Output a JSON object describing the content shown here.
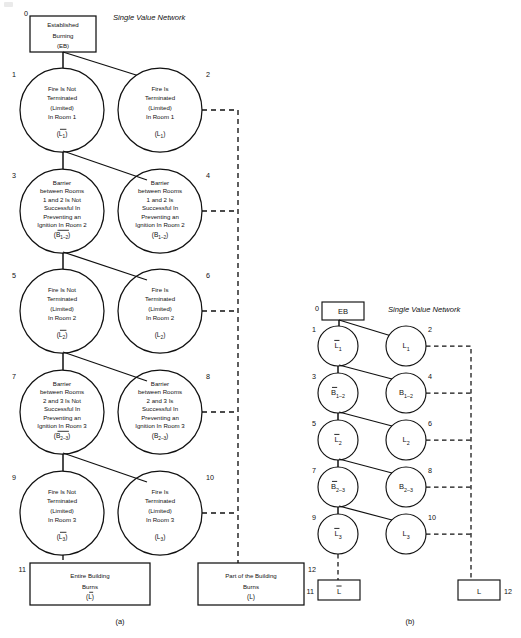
{
  "figure": {
    "panel_a_caption": "(a)",
    "panel_b_caption": "(b)",
    "network_title": "Single Value Network"
  },
  "panel_a": {
    "root": {
      "number": "0",
      "lines": [
        "Established",
        "Burning",
        "(EB)"
      ],
      "shape": "rectangle"
    },
    "nodes": [
      {
        "number": "1",
        "lines": [
          "Fire Is Not",
          "Terminated",
          "(Limited)",
          "In Room 1"
        ],
        "symbol": "L",
        "sub": "1",
        "overbar": true,
        "column": "left"
      },
      {
        "number": "2",
        "lines": [
          "Fire Is",
          "Terminated",
          "(Limited)",
          "In Room 1"
        ],
        "symbol": "L",
        "sub": "1",
        "overbar": false,
        "column": "right"
      },
      {
        "number": "3",
        "lines": [
          "Barrier",
          "between Rooms",
          "1 and 2 Is Not",
          "Successful In",
          "Preventing an",
          "Ignition In Room 2"
        ],
        "symbol": "B",
        "sub": "1–2",
        "overbar": true,
        "column": "left"
      },
      {
        "number": "4",
        "lines": [
          "Barrier",
          "between Rooms",
          "1 and 2 Is",
          "Successful In",
          "Preventing an",
          "Ignition In Room 2"
        ],
        "symbol": "B",
        "sub": "1–2",
        "overbar": false,
        "column": "right"
      },
      {
        "number": "5",
        "lines": [
          "Fire Is Not",
          "Terminated",
          "(Limited)",
          "In Room 2"
        ],
        "symbol": "L",
        "sub": "2",
        "overbar": true,
        "column": "left"
      },
      {
        "number": "6",
        "lines": [
          "Fire Is",
          "Terminated",
          "(Limited)",
          "In Room 2"
        ],
        "symbol": "L",
        "sub": "2",
        "overbar": false,
        "column": "right"
      },
      {
        "number": "7",
        "lines": [
          "Barrier",
          "between Rooms",
          "2 and 3 Is Not",
          "Successful In",
          "Preventing an",
          "Ignition In Room 3"
        ],
        "symbol": "B",
        "sub": "2–3",
        "overbar": true,
        "column": "left"
      },
      {
        "number": "8",
        "lines": [
          "Barrier",
          "between Rooms",
          "2 and 3 Is",
          "Successful In",
          "Preventing an",
          "Ignition In Room 3"
        ],
        "symbol": "B",
        "sub": "2–3",
        "overbar": false,
        "column": "right"
      },
      {
        "number": "9",
        "lines": [
          "Fire Is Not",
          "Terminated",
          "(Limited)",
          "In Room 3"
        ],
        "symbol": "L",
        "sub": "3",
        "overbar": true,
        "column": "left"
      },
      {
        "number": "10",
        "lines": [
          "Fire Is",
          "Terminated",
          "(Limited)",
          "In Room 3"
        ],
        "symbol": "L",
        "sub": "3",
        "overbar": false,
        "column": "right"
      }
    ],
    "terminals": [
      {
        "number": "11",
        "lines": [
          "Entire Building",
          "Burns"
        ],
        "symbol": "L",
        "overbar": true,
        "column": "left"
      },
      {
        "number": "12",
        "lines": [
          "Part of the Building",
          "Burns"
        ],
        "symbol": "L",
        "overbar": false,
        "column": "right"
      }
    ]
  },
  "panel_b": {
    "root": {
      "number": "0",
      "symbol": "EB",
      "shape": "rectangle"
    },
    "nodes": [
      {
        "number": "1",
        "symbol": "L",
        "sub": "1",
        "overbar": true,
        "column": "left"
      },
      {
        "number": "2",
        "symbol": "L",
        "sub": "1",
        "overbar": false,
        "column": "right"
      },
      {
        "number": "3",
        "symbol": "B",
        "sub": "1–2",
        "overbar": true,
        "column": "left"
      },
      {
        "number": "4",
        "symbol": "B",
        "sub": "1–2",
        "overbar": false,
        "column": "right"
      },
      {
        "number": "5",
        "symbol": "L",
        "sub": "2",
        "overbar": true,
        "column": "left"
      },
      {
        "number": "6",
        "symbol": "L",
        "sub": "2",
        "overbar": false,
        "column": "right"
      },
      {
        "number": "7",
        "symbol": "B",
        "sub": "2–3",
        "overbar": true,
        "column": "left"
      },
      {
        "number": "8",
        "symbol": "B",
        "sub": "2–3",
        "overbar": false,
        "column": "right"
      },
      {
        "number": "9",
        "symbol": "L",
        "sub": "3",
        "overbar": true,
        "column": "left"
      },
      {
        "number": "10",
        "symbol": "L",
        "sub": "3",
        "overbar": false,
        "column": "right"
      }
    ],
    "terminals": [
      {
        "number": "11",
        "symbol": "L",
        "overbar": true,
        "column": "left"
      },
      {
        "number": "12",
        "symbol": "L",
        "overbar": false,
        "column": "right"
      }
    ]
  },
  "colors": {
    "stroke": "#111111",
    "background": "#ffffff"
  }
}
